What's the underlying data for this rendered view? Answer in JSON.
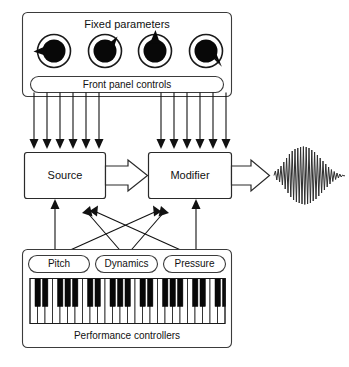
{
  "diagram": {
    "title_fixed_panel": "Fixed parameters",
    "front_panel_label": "Front panel controls",
    "source_label": "Source",
    "modifier_label": "Modifier",
    "performance_label": "Performance controllers",
    "controllers": [
      {
        "id": "pitch",
        "label": "Pitch"
      },
      {
        "id": "dynamics",
        "label": "Dynamics"
      },
      {
        "id": "pressure",
        "label": "Pressure"
      }
    ],
    "knobs": [
      {
        "id": "knob-1",
        "pointer_angle_deg": 260
      },
      {
        "id": "knob-2",
        "pointer_angle_deg": 42
      },
      {
        "id": "knob-3",
        "pointer_angle_deg": 0
      },
      {
        "id": "knob-4",
        "pointer_angle_deg": 135
      }
    ],
    "control_line_counts": {
      "to_source": 6,
      "to_modifier": 6
    },
    "signal_flow": [
      {
        "from": "Source",
        "to": "Modifier",
        "style": "block-arrow"
      },
      {
        "from": "Modifier",
        "to": "Output waveform",
        "style": "block-arrow"
      }
    ],
    "performance_routing": [
      {
        "from": "Pitch",
        "to": "Source"
      },
      {
        "from": "Pitch",
        "to": "Modifier"
      },
      {
        "from": "Dynamics",
        "to": "Source"
      },
      {
        "from": "Dynamics",
        "to": "Modifier"
      },
      {
        "from": "Pressure",
        "to": "Source"
      },
      {
        "from": "Pressure",
        "to": "Modifier"
      }
    ],
    "output": {
      "name": "output-waveform",
      "description": "amplitude-enveloped oscillating waveform"
    },
    "colors": {
      "ink": "#111111",
      "panel_stroke": "#3b3b3b",
      "knob_fill": "#080808",
      "background": "#ffffff"
    }
  }
}
